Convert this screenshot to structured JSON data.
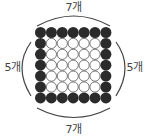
{
  "diagram": {
    "grid": {
      "rows": 7,
      "cols": 7,
      "border_color": "#2b2b2b",
      "inner_fill": "#ffffff",
      "inner_stroke": "#555555"
    },
    "labels": {
      "top": "7개",
      "bottom": "7개",
      "left": "5개",
      "right": "5개"
    },
    "arc_color": "#444444"
  }
}
